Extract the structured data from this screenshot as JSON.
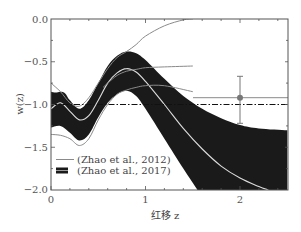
{
  "chart_data": {
    "type": "line",
    "title": "",
    "xlabel": "红移 z",
    "ylabel": "w(z)",
    "xlim": [
      0,
      2.5
    ],
    "ylim": [
      -2.0,
      0.0
    ],
    "x_ticks": [
      0,
      1,
      2
    ],
    "x_tick_labels": [
      "0",
      "1",
      "2"
    ],
    "y_ticks": [
      0.0,
      -0.5,
      -1.0,
      -1.5,
      -2.0
    ],
    "y_tick_labels": [
      "0.0",
      "−0.5",
      "−1.0",
      "−1.5",
      "−2.0"
    ],
    "grid": false,
    "legend_position": "lower left",
    "legend": [
      {
        "label": "(Zhao et al., 2012)",
        "style": "gray-line"
      },
      {
        "label": "(Zhao et al., 2017)",
        "style": "black-band"
      }
    ],
    "series": [
      {
        "name": "Zhao et al., 2017 band upper",
        "x": [
          0,
          0.05,
          0.1,
          0.15,
          0.2,
          0.3,
          0.4,
          0.5,
          0.6,
          0.7,
          0.8,
          0.9,
          1.0,
          1.2,
          1.4,
          1.6,
          1.8,
          2.0,
          2.2,
          2.5
        ],
        "y": [
          -0.85,
          -0.86,
          -0.85,
          -0.87,
          -0.95,
          -1.05,
          -0.95,
          -0.75,
          -0.55,
          -0.43,
          -0.38,
          -0.4,
          -0.48,
          -0.7,
          -0.9,
          -1.05,
          -1.16,
          -1.24,
          -1.28,
          -1.3
        ]
      },
      {
        "name": "Zhao et al., 2017 band lower",
        "x": [
          0,
          0.1,
          0.2,
          0.3,
          0.4,
          0.5,
          0.6,
          0.7,
          0.8,
          0.9,
          1.0,
          1.2,
          1.4,
          1.55
        ],
        "y": [
          -1.27,
          -1.25,
          -1.33,
          -1.42,
          -1.35,
          -1.15,
          -0.98,
          -0.88,
          -0.84,
          -0.9,
          -1.05,
          -1.4,
          -1.75,
          -2.0
        ]
      },
      {
        "name": "Zhao et al., 2017 best fit",
        "x": [
          0,
          0.1,
          0.2,
          0.3,
          0.4,
          0.5,
          0.6,
          0.7,
          0.8,
          0.9,
          1.0,
          1.2,
          1.4,
          1.6,
          1.8,
          2.0,
          2.2,
          2.3
        ],
        "y": [
          -1.05,
          -0.98,
          -1.08,
          -1.18,
          -1.13,
          -0.95,
          -0.75,
          -0.63,
          -0.58,
          -0.62,
          -0.73,
          -1.0,
          -1.28,
          -1.52,
          -1.72,
          -1.86,
          -1.96,
          -2.0
        ]
      },
      {
        "name": "Zhao et al., 2012 upper",
        "x": [
          0,
          0.1,
          0.2,
          0.3,
          0.4,
          0.5,
          0.6,
          0.7,
          0.8,
          0.9,
          1.0,
          1.2,
          1.4,
          1.5
        ],
        "y": [
          -0.75,
          -0.85,
          -0.98,
          -1.02,
          -0.92,
          -0.75,
          -0.58,
          -0.45,
          -0.38,
          -0.3,
          -0.2,
          -0.08,
          -0.01,
          0.0
        ]
      },
      {
        "name": "Zhao et al., 2012 middle",
        "x": [
          0.55,
          0.6,
          0.7,
          0.8,
          0.9,
          1.0,
          1.2,
          1.5
        ],
        "y": [
          -0.8,
          -0.75,
          -0.66,
          -0.61,
          -0.59,
          -0.57,
          -0.56,
          -0.55
        ]
      },
      {
        "name": "Zhao et al., 2012 lower",
        "x": [
          0,
          0.1,
          0.2,
          0.3,
          0.4,
          0.5,
          0.6,
          0.7,
          0.8,
          0.9,
          1.0,
          1.2,
          1.5
        ],
        "y": [
          -1.35,
          -1.36,
          -1.4,
          -1.48,
          -1.4,
          -1.18,
          -1.0,
          -0.88,
          -0.83,
          -0.8,
          -0.78,
          -0.78,
          -0.85
        ]
      },
      {
        "name": "reference w = -1",
        "x": [
          0,
          2.5
        ],
        "y": [
          -1.0,
          -1.0
        ],
        "style": "dash-dot"
      },
      {
        "name": "high-z constant",
        "x": [
          1.5,
          2.5
        ],
        "y": [
          -0.92,
          -0.92
        ],
        "style": "gray-line"
      }
    ],
    "points": [
      {
        "x": 2.0,
        "y": -0.92,
        "yerr_low": -1.22,
        "yerr_high": -0.67
      }
    ]
  },
  "labels": {
    "xlabel": "红移 z",
    "ylabel": "w(z)",
    "legend_2012": "(Zhao et al., 2012)",
    "legend_2017": "(Zhao et al., 2017)",
    "xt0": "0",
    "xt1": "1",
    "xt2": "2",
    "yt0": "0.0",
    "yt1": "−0.5",
    "yt2": "−1.0",
    "yt3": "−1.5",
    "yt4": "−2.0"
  },
  "colors": {
    "band": "#1a1a1a",
    "gray_line": "#8a8a8a",
    "center_line": "#dddddd",
    "axis": "#555555"
  }
}
